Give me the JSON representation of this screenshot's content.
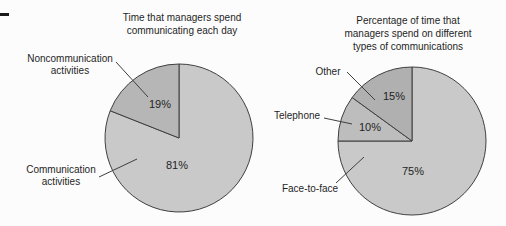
{
  "figure": {
    "background": "#fcfcfc",
    "text_color": "#1f1f1f"
  },
  "chart_data": [
    {
      "type": "pie",
      "title": "Time that managers spend\ncommunicating each day",
      "direction": "clockwise",
      "start_angle_deg": 0,
      "outline_color": "#3f3f3f",
      "layout": {
        "center_x": 179,
        "center_y": 138,
        "radius": 74
      },
      "slices": [
        {
          "label": "Communication activities",
          "callout": "Communication\nactivities",
          "value": 81,
          "value_label": "81%",
          "color": "#c9c9c9",
          "leader": [
            99,
            177,
            137,
            159
          ]
        },
        {
          "label": "Noncommunication activities",
          "callout": "Noncommunication\nactivities",
          "value": 19,
          "value_label": "19%",
          "color": "#b6b6b6",
          "leader": [
            116,
            62,
            148,
            97
          ]
        }
      ]
    },
    {
      "type": "pie",
      "title": "Percentage of time that\nmanagers spend on different\ntypes of communications",
      "direction": "clockwise",
      "start_angle_deg": 0,
      "outline_color": "#3f3f3f",
      "layout": {
        "center_x": 412,
        "center_y": 141,
        "radius": 74
      },
      "slices": [
        {
          "label": "Face-to-face",
          "callout": "Face-to-face",
          "value": 75,
          "value_label": "75%",
          "color": "#c9c9c9",
          "leader": [
            336,
            183,
            364,
            157
          ]
        },
        {
          "label": "Telephone",
          "callout": "Telephone",
          "value": 10,
          "value_label": "10%",
          "color": "#bdbdbd",
          "leader": [
            324,
            118,
            352,
            124
          ]
        },
        {
          "label": "Other",
          "callout": "Other",
          "value": 15,
          "value_label": "15%",
          "color": "#b0b0b0",
          "leader": [
            347,
            72,
            375,
            100
          ]
        }
      ]
    }
  ]
}
